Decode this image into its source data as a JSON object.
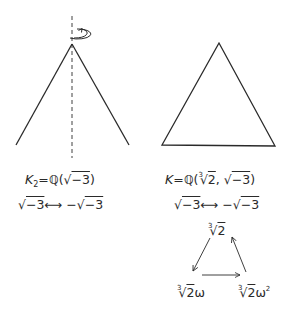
{
  "left_figure": {
    "name": "cone-rotation",
    "field_label": {
      "var": "K",
      "subscript": "2",
      "equals": "=",
      "field": "ℚ",
      "open": "(",
      "radicand": "−3",
      "close": ")"
    },
    "automorphism": {
      "from_radicand": "−3",
      "arrow": "⟷",
      "to_sign": "−",
      "to_radicand": "−3"
    },
    "colors": {
      "stroke": "#2a2a2a"
    }
  },
  "right_figure": {
    "name": "equilateral-triangle",
    "field_label": {
      "var": "K",
      "equals": "=",
      "field": "ℚ",
      "open": "(",
      "cube_index": "3",
      "cube_radicand": "2",
      "comma": ",",
      "sqrt_radicand": "−3",
      "close": ")"
    },
    "automorphism": {
      "from_radicand": "−3",
      "arrow": "⟷",
      "to_sign": "−",
      "to_radicand": "−3"
    },
    "cycle": {
      "top": {
        "index": "3",
        "radicand": "2",
        "suffix": ""
      },
      "bottom_left": {
        "index": "3",
        "radicand": "2",
        "suffix": "ω"
      },
      "bottom_right": {
        "index": "3",
        "radicand": "2",
        "suffix": "ω",
        "exponent": "2"
      }
    }
  }
}
